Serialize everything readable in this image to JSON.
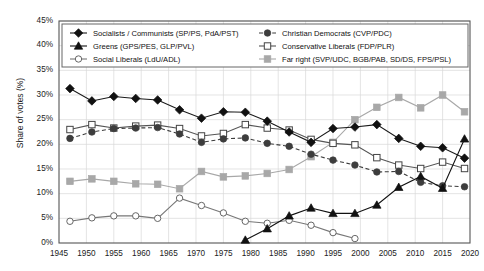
{
  "chart_data": {
    "type": "line",
    "title": "",
    "xlabel": "",
    "ylabel": "Share of votes (%)",
    "xlim": [
      1945,
      2020
    ],
    "ylim": [
      0,
      45
    ],
    "xticks": [
      1945,
      1950,
      1955,
      1960,
      1965,
      1970,
      1975,
      1980,
      1985,
      1990,
      1995,
      2000,
      2005,
      2010,
      2015,
      2020
    ],
    "yticks": [
      0,
      5,
      10,
      15,
      20,
      25,
      30,
      35,
      40,
      45
    ],
    "ytick_labels": [
      "0%",
      "5%",
      "10%",
      "15%",
      "20%",
      "25%",
      "30%",
      "35%",
      "40%",
      "45%"
    ],
    "grid": true,
    "legend_position": "top-inside",
    "series": [
      {
        "name": "Socialists / Communists (SP/PS, PdA/PST)",
        "marker": "filled-diamond",
        "line": "solid",
        "color": "#1a1a1a",
        "x": [
          1947,
          1951,
          1955,
          1959,
          1963,
          1967,
          1971,
          1975,
          1979,
          1983,
          1987,
          1991,
          1995,
          1999,
          2003,
          2007,
          2011,
          2015,
          2019
        ],
        "y": [
          31.3,
          28.8,
          29.7,
          29.3,
          29.0,
          27.0,
          25.3,
          26.6,
          26.5,
          24.7,
          22.5,
          20.4,
          23.2,
          23.5,
          24.0,
          21.2,
          19.6,
          19.3,
          17.2
        ]
      },
      {
        "name": "Christian Democrats (CVP/PDC)",
        "marker": "filled-circle",
        "line": "dashed",
        "color": "#3d3d3d",
        "x": [
          1947,
          1951,
          1955,
          1959,
          1963,
          1967,
          1971,
          1975,
          1979,
          1983,
          1987,
          1991,
          1995,
          1999,
          2003,
          2007,
          2011,
          2015,
          2019
        ],
        "y": [
          21.2,
          22.5,
          23.2,
          23.3,
          23.4,
          22.1,
          20.4,
          21.1,
          21.3,
          20.2,
          19.6,
          18.0,
          16.8,
          15.8,
          14.4,
          14.5,
          12.3,
          11.6,
          11.4
        ]
      },
      {
        "name": "Greens (GPS/PES, GLP/PVL)",
        "marker": "filled-triangle",
        "line": "solid",
        "color": "#111111",
        "x": [
          1979,
          1983,
          1987,
          1991,
          1995,
          1999,
          2003,
          2007,
          2011,
          2015,
          2019
        ],
        "y": [
          0.6,
          2.9,
          5.5,
          7.1,
          6.0,
          6.0,
          7.7,
          11.3,
          13.5,
          11.1,
          21.1
        ]
      },
      {
        "name": "Conservative Liberals (FDP/PLR)",
        "marker": "open-square",
        "line": "solid",
        "color": "#555555",
        "x": [
          1947,
          1951,
          1955,
          1959,
          1963,
          1967,
          1971,
          1975,
          1979,
          1983,
          1987,
          1991,
          1995,
          1999,
          2003,
          2007,
          2011,
          2015,
          2019
        ],
        "y": [
          23.0,
          24.0,
          23.3,
          23.7,
          23.9,
          23.2,
          21.7,
          22.2,
          24.0,
          23.3,
          22.9,
          21.0,
          20.2,
          19.9,
          17.3,
          15.8,
          15.1,
          16.4,
          15.1
        ]
      },
      {
        "name": "Social Liberals (LdU/ADL)",
        "marker": "open-circle",
        "line": "solid",
        "color": "#777777",
        "x": [
          1947,
          1951,
          1955,
          1959,
          1963,
          1967,
          1971,
          1975,
          1979,
          1983,
          1987,
          1991,
          1995,
          1999
        ],
        "y": [
          4.4,
          5.1,
          5.5,
          5.5,
          5.0,
          9.1,
          7.6,
          6.1,
          4.4,
          4.0,
          4.6,
          3.6,
          2.1,
          0.9
        ]
      },
      {
        "name": "Far right (SVP/UDC, BGB/PAB, SD/DS, FPS/PSL)",
        "marker": "filled-square-grey",
        "line": "solid",
        "color": "#a8a8a8",
        "x": [
          1947,
          1951,
          1955,
          1959,
          1963,
          1967,
          1971,
          1975,
          1979,
          1983,
          1987,
          1991,
          1995,
          1999,
          2003,
          2007,
          2011,
          2015,
          2019
        ],
        "y": [
          12.5,
          13.0,
          12.5,
          12.0,
          11.9,
          11.0,
          14.5,
          13.4,
          13.6,
          14.1,
          14.9,
          17.5,
          20.4,
          25.0,
          27.5,
          29.5,
          27.4,
          30.0,
          26.6
        ]
      }
    ]
  },
  "legend": {
    "items": [
      {
        "label": "Socialists / Communists (SP/PS, PdA/PST)",
        "marker": "filled-diamond"
      },
      {
        "label": "Christian Democrats (CVP/PDC)",
        "marker": "filled-circle"
      },
      {
        "label": "Greens (GPS/PES, GLP/PVL)",
        "marker": "filled-triangle"
      },
      {
        "label": "Conservative Liberals (FDP/PLR)",
        "marker": "open-square"
      },
      {
        "label": "Social Liberals (LdU/ADL)",
        "marker": "open-circle"
      },
      {
        "label": "Far right (SVP/UDC, BGB/PAB, SD/DS, FPS/PSL)",
        "marker": "filled-square-grey"
      }
    ]
  },
  "colors": {
    "grid": "#d9d9d9",
    "axis": "#555555",
    "text": "#222222",
    "far_right": "#a8a8a8",
    "social_liberals": "#777777"
  }
}
